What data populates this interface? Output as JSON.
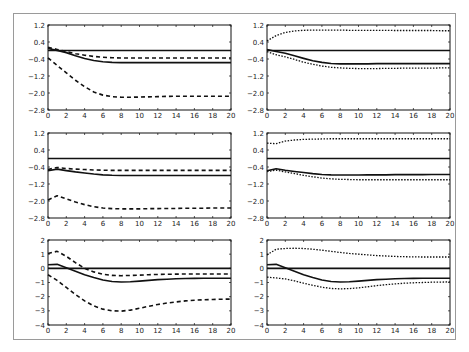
{
  "chart_data": [
    {
      "type": "line",
      "panel": "row1-left",
      "x": [
        0,
        1,
        2,
        3,
        4,
        5,
        6,
        7,
        8,
        9,
        10,
        11,
        12,
        13,
        14,
        15,
        16,
        17,
        18,
        19,
        20
      ],
      "ylim": [
        -2.8,
        1.2
      ],
      "yticks": [
        "1.2",
        "0.4",
        "-0.4",
        "-1.2",
        "-2.0",
        "-2.8"
      ],
      "xticks": [
        "0",
        "2",
        "4",
        "6",
        "8",
        "10",
        "12",
        "14",
        "16",
        "18",
        "20"
      ],
      "series": [
        {
          "name": "zero",
          "style": "solid",
          "values": [
            0,
            0,
            0,
            0,
            0,
            0,
            0,
            0,
            0,
            0,
            0,
            0,
            0,
            0,
            0,
            0,
            0,
            0,
            0,
            0,
            0
          ]
        },
        {
          "name": "response",
          "style": "solid",
          "values": [
            0.1,
            0.0,
            -0.1,
            -0.25,
            -0.38,
            -0.47,
            -0.53,
            -0.56,
            -0.57,
            -0.57,
            -0.57,
            -0.57,
            -0.57,
            -0.57,
            -0.57,
            -0.57,
            -0.57,
            -0.57,
            -0.57,
            -0.57,
            -0.57
          ]
        },
        {
          "name": "upper band",
          "style": "dashed",
          "values": [
            0.15,
            0.05,
            -0.05,
            -0.15,
            -0.22,
            -0.28,
            -0.32,
            -0.34,
            -0.35,
            -0.35,
            -0.35,
            -0.35,
            -0.35,
            -0.35,
            -0.35,
            -0.35,
            -0.35,
            -0.35,
            -0.35,
            -0.35,
            -0.35
          ]
        },
        {
          "name": "lower band",
          "style": "dashed",
          "values": [
            -0.35,
            -0.7,
            -1.05,
            -1.4,
            -1.7,
            -1.95,
            -2.1,
            -2.17,
            -2.2,
            -2.2,
            -2.19,
            -2.18,
            -2.17,
            -2.16,
            -2.15,
            -2.15,
            -2.15,
            -2.15,
            -2.15,
            -2.15,
            -2.15
          ]
        }
      ]
    },
    {
      "type": "line",
      "panel": "row1-right",
      "x": [
        0,
        1,
        2,
        3,
        4,
        5,
        6,
        7,
        8,
        9,
        10,
        11,
        12,
        13,
        14,
        15,
        16,
        17,
        18,
        19,
        20
      ],
      "ylim": [
        -2.8,
        1.2
      ],
      "yticks": [
        "1.2",
        "0.4",
        "-0.4",
        "-1.2",
        "-2.0",
        "-2.8"
      ],
      "xticks": [
        "0",
        "2",
        "4",
        "6",
        "8",
        "10",
        "12",
        "14",
        "16",
        "18",
        "20"
      ],
      "series": [
        {
          "name": "zero",
          "style": "solid",
          "values": [
            0,
            0,
            0,
            0,
            0,
            0,
            0,
            0,
            0,
            0,
            0,
            0,
            0,
            0,
            0,
            0,
            0,
            0,
            0,
            0,
            0
          ]
        },
        {
          "name": "response",
          "style": "solid",
          "values": [
            0.05,
            -0.05,
            -0.13,
            -0.25,
            -0.37,
            -0.48,
            -0.56,
            -0.61,
            -0.63,
            -0.63,
            -0.63,
            -0.63,
            -0.62,
            -0.62,
            -0.62,
            -0.62,
            -0.62,
            -0.62,
            -0.62,
            -0.62,
            -0.62
          ]
        },
        {
          "name": "upper band",
          "style": "dotted",
          "values": [
            0.45,
            0.7,
            0.85,
            0.92,
            0.95,
            0.96,
            0.96,
            0.96,
            0.96,
            0.95,
            0.95,
            0.95,
            0.95,
            0.95,
            0.94,
            0.94,
            0.94,
            0.94,
            0.94,
            0.93,
            0.93
          ]
        },
        {
          "name": "lower band",
          "style": "dotted",
          "values": [
            -0.05,
            -0.2,
            -0.3,
            -0.42,
            -0.55,
            -0.65,
            -0.73,
            -0.79,
            -0.82,
            -0.84,
            -0.85,
            -0.85,
            -0.85,
            -0.84,
            -0.84,
            -0.83,
            -0.83,
            -0.83,
            -0.83,
            -0.82,
            -0.82
          ]
        }
      ]
    },
    {
      "type": "line",
      "panel": "row2-left",
      "x": [
        0,
        1,
        2,
        3,
        4,
        5,
        6,
        7,
        8,
        9,
        10,
        11,
        12,
        13,
        14,
        15,
        16,
        17,
        18,
        19,
        20
      ],
      "ylim": [
        -2.8,
        1.2
      ],
      "yticks": [
        "1.2",
        "0.4",
        "-0.4",
        "-1.2",
        "-2.0",
        "-2.8"
      ],
      "xticks": [
        "0",
        "2",
        "4",
        "6",
        "8",
        "10",
        "12",
        "14",
        "16",
        "18",
        "20"
      ],
      "series": [
        {
          "name": "zero",
          "style": "solid",
          "values": [
            0,
            0,
            0,
            0,
            0,
            0,
            0,
            0,
            0,
            0,
            0,
            0,
            0,
            0,
            0,
            0,
            0,
            0,
            0,
            0,
            0
          ]
        },
        {
          "name": "response",
          "style": "solid",
          "values": [
            -0.58,
            -0.5,
            -0.57,
            -0.63,
            -0.68,
            -0.73,
            -0.77,
            -0.79,
            -0.8,
            -0.8,
            -0.8,
            -0.8,
            -0.8,
            -0.8,
            -0.8,
            -0.8,
            -0.8,
            -0.8,
            -0.8,
            -0.8,
            -0.8
          ]
        },
        {
          "name": "upper band",
          "style": "dashed",
          "values": [
            -0.52,
            -0.42,
            -0.47,
            -0.5,
            -0.52,
            -0.54,
            -0.55,
            -0.56,
            -0.56,
            -0.56,
            -0.56,
            -0.56,
            -0.56,
            -0.56,
            -0.56,
            -0.56,
            -0.56,
            -0.56,
            -0.56,
            -0.56,
            -0.56
          ]
        },
        {
          "name": "lower band",
          "style": "dashed",
          "values": [
            -1.95,
            -1.75,
            -1.9,
            -2.05,
            -2.17,
            -2.27,
            -2.33,
            -2.36,
            -2.37,
            -2.37,
            -2.37,
            -2.36,
            -2.36,
            -2.35,
            -2.35,
            -2.34,
            -2.34,
            -2.34,
            -2.33,
            -2.33,
            -2.33
          ]
        }
      ]
    },
    {
      "type": "line",
      "panel": "row2-right",
      "x": [
        0,
        1,
        2,
        3,
        4,
        5,
        6,
        7,
        8,
        9,
        10,
        11,
        12,
        13,
        14,
        15,
        16,
        17,
        18,
        19,
        20
      ],
      "ylim": [
        -2.8,
        1.2
      ],
      "yticks": [
        "1.2",
        "0.4",
        "-0.4",
        "-1.2",
        "-2.0",
        "-2.8"
      ],
      "xticks": [
        "0",
        "2",
        "4",
        "6",
        "8",
        "10",
        "12",
        "14",
        "16",
        "18",
        "20"
      ],
      "series": [
        {
          "name": "zero",
          "style": "solid",
          "values": [
            0,
            0,
            0,
            0,
            0,
            0,
            0,
            0,
            0,
            0,
            0,
            0,
            0,
            0,
            0,
            0,
            0,
            0,
            0,
            0,
            0
          ]
        },
        {
          "name": "response",
          "style": "solid",
          "values": [
            -0.58,
            -0.48,
            -0.55,
            -0.61,
            -0.66,
            -0.71,
            -0.75,
            -0.77,
            -0.78,
            -0.78,
            -0.78,
            -0.77,
            -0.77,
            -0.77,
            -0.76,
            -0.76,
            -0.76,
            -0.76,
            -0.75,
            -0.75,
            -0.75
          ]
        },
        {
          "name": "upper band",
          "style": "dotted",
          "values": [
            0.72,
            0.7,
            0.82,
            0.87,
            0.9,
            0.91,
            0.92,
            0.93,
            0.93,
            0.93,
            0.93,
            0.93,
            0.93,
            0.93,
            0.93,
            0.93,
            0.93,
            0.93,
            0.93,
            0.93,
            0.93
          ]
        },
        {
          "name": "lower band",
          "style": "dotted",
          "values": [
            -0.62,
            -0.55,
            -0.63,
            -0.71,
            -0.79,
            -0.86,
            -0.92,
            -0.96,
            -0.98,
            -0.99,
            -1.0,
            -1.0,
            -1.0,
            -1.0,
            -1.0,
            -1.0,
            -1.0,
            -1.0,
            -1.0,
            -1.0,
            -1.0
          ]
        }
      ]
    },
    {
      "type": "line",
      "panel": "row3-left",
      "x": [
        0,
        1,
        2,
        3,
        4,
        5,
        6,
        7,
        8,
        9,
        10,
        11,
        12,
        13,
        14,
        15,
        16,
        17,
        18,
        19,
        20
      ],
      "ylim": [
        -4,
        2
      ],
      "yticks": [
        "2",
        "1",
        "0",
        "-1",
        "-2",
        "-3",
        "-4"
      ],
      "xticks": [
        "0",
        "2",
        "4",
        "6",
        "8",
        "10",
        "12",
        "14",
        "16",
        "18",
        "20"
      ],
      "series": [
        {
          "name": "zero",
          "style": "solid",
          "values": [
            0,
            0,
            0,
            0,
            0,
            0,
            0,
            0,
            0,
            0,
            0,
            0,
            0,
            0,
            0,
            0,
            0,
            0,
            0,
            0,
            0
          ]
        },
        {
          "name": "response",
          "style": "solid",
          "values": [
            0.25,
            0.28,
            0.05,
            -0.2,
            -0.45,
            -0.65,
            -0.82,
            -0.93,
            -0.97,
            -0.95,
            -0.9,
            -0.85,
            -0.8,
            -0.77,
            -0.74,
            -0.72,
            -0.71,
            -0.7,
            -0.7,
            -0.7,
            -0.7
          ]
        },
        {
          "name": "upper band",
          "style": "dashed",
          "values": [
            1.05,
            1.2,
            0.85,
            0.4,
            0.0,
            -0.25,
            -0.42,
            -0.5,
            -0.52,
            -0.5,
            -0.48,
            -0.45,
            -0.43,
            -0.42,
            -0.41,
            -0.4,
            -0.4,
            -0.4,
            -0.4,
            -0.4,
            -0.4
          ]
        },
        {
          "name": "lower band",
          "style": "dashed",
          "values": [
            -0.45,
            -0.85,
            -1.35,
            -1.85,
            -2.3,
            -2.65,
            -2.88,
            -3.0,
            -3.02,
            -2.95,
            -2.82,
            -2.68,
            -2.55,
            -2.45,
            -2.37,
            -2.3,
            -2.25,
            -2.22,
            -2.2,
            -2.18,
            -2.17
          ]
        }
      ]
    },
    {
      "type": "line",
      "panel": "row3-right",
      "x": [
        0,
        1,
        2,
        3,
        4,
        5,
        6,
        7,
        8,
        9,
        10,
        11,
        12,
        13,
        14,
        15,
        16,
        17,
        18,
        19,
        20
      ],
      "ylim": [
        -4,
        2
      ],
      "yticks": [
        "2",
        "1",
        "0",
        "-1",
        "-2",
        "-3",
        "-4"
      ],
      "xticks": [
        "0",
        "2",
        "4",
        "6",
        "8",
        "10",
        "12",
        "14",
        "16",
        "18",
        "20"
      ],
      "series": [
        {
          "name": "zero",
          "style": "solid",
          "values": [
            0,
            0,
            0,
            0,
            0,
            0,
            0,
            0,
            0,
            0,
            0,
            0,
            0,
            0,
            0,
            0,
            0,
            0,
            0,
            0,
            0
          ]
        },
        {
          "name": "response",
          "style": "solid",
          "values": [
            0.25,
            0.28,
            0.05,
            -0.2,
            -0.45,
            -0.65,
            -0.82,
            -0.93,
            -0.97,
            -0.95,
            -0.9,
            -0.85,
            -0.8,
            -0.77,
            -0.74,
            -0.72,
            -0.71,
            -0.7,
            -0.7,
            -0.7,
            -0.7
          ]
        },
        {
          "name": "upper band",
          "style": "dotted",
          "values": [
            0.95,
            1.35,
            1.4,
            1.42,
            1.4,
            1.35,
            1.28,
            1.2,
            1.12,
            1.05,
            1.0,
            0.95,
            0.9,
            0.87,
            0.84,
            0.82,
            0.81,
            0.8,
            0.8,
            0.8,
            0.8
          ]
        },
        {
          "name": "lower band",
          "style": "dotted",
          "values": [
            -0.62,
            -0.68,
            -0.75,
            -0.88,
            -1.05,
            -1.2,
            -1.33,
            -1.42,
            -1.45,
            -1.43,
            -1.38,
            -1.3,
            -1.22,
            -1.15,
            -1.1,
            -1.05,
            -1.02,
            -1.0,
            -0.98,
            -0.97,
            -0.96
          ]
        }
      ]
    }
  ],
  "layout": {
    "panels": [
      {
        "left": 48,
        "top": 25,
        "width": 183,
        "height": 85
      },
      {
        "left": 267,
        "top": 25,
        "width": 183,
        "height": 85
      },
      {
        "left": 48,
        "top": 133,
        "width": 183,
        "height": 85
      },
      {
        "left": 267,
        "top": 133,
        "width": 183,
        "height": 85
      },
      {
        "left": 48,
        "top": 240,
        "width": 183,
        "height": 85
      },
      {
        "left": 267,
        "top": 240,
        "width": 183,
        "height": 85
      }
    ]
  }
}
